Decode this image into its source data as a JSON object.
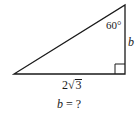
{
  "diagram": {
    "type": "right-triangle",
    "vertices": {
      "top": [
        125,
        5
      ],
      "bottom_right": [
        125,
        74
      ],
      "bottom_left": [
        14,
        74
      ]
    },
    "right_angle_marker": {
      "at": "bottom_right",
      "size": 10
    },
    "stroke_color": "#1a1a1a",
    "labels": {
      "angle": "60°",
      "vertical_side": "b",
      "base_coefficient": "2",
      "base_radical": "√",
      "base_radicand": "3"
    },
    "question": {
      "variable": "b",
      "equals": " = ",
      "unknown": "?"
    }
  }
}
